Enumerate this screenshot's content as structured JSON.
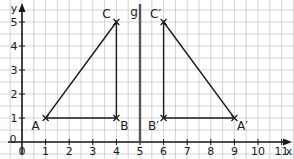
{
  "diagram": {
    "type": "coordinate-grid-reflection",
    "axes": {
      "x_label": "x",
      "y_label": "y",
      "x_ticks": [
        "0",
        "1",
        "2",
        "3",
        "4",
        "5",
        "6",
        "7",
        "8",
        "9",
        "10",
        "11"
      ],
      "y_ticks": [
        "0",
        "1",
        "2",
        "3",
        "4",
        "5"
      ]
    },
    "mirror_line": {
      "label": "g",
      "x": 5
    },
    "points": [
      {
        "id": "A",
        "label": "A",
        "x": 1,
        "y": 1
      },
      {
        "id": "B",
        "label": "B",
        "x": 4,
        "y": 1
      },
      {
        "id": "C",
        "label": "C",
        "x": 4,
        "y": 5
      },
      {
        "id": "A2",
        "label": "A′",
        "x": 9,
        "y": 1
      },
      {
        "id": "B2",
        "label": "B′",
        "x": 6,
        "y": 1
      },
      {
        "id": "C2",
        "label": "C′",
        "x": 6,
        "y": 5
      }
    ],
    "triangles": [
      {
        "name": "ABC",
        "vertices": [
          "A",
          "B",
          "C"
        ]
      },
      {
        "name": "A′B′C′",
        "vertices": [
          "A2",
          "B2",
          "C2"
        ]
      }
    ],
    "colors": {
      "grid": "#c8c8c8",
      "axis": "#1a1a1a",
      "mirror": "#555555",
      "shape": "#1a1a1a"
    }
  }
}
